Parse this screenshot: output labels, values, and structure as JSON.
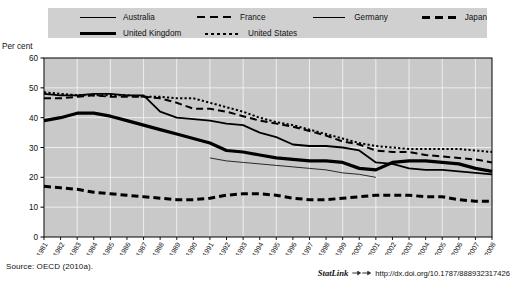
{
  "title_strip": "Figure cropped heading",
  "axis_note": "Per cent",
  "legend": {
    "items": [
      {
        "label": "Australia",
        "style": "solid-med"
      },
      {
        "label": "France",
        "style": "dash-long"
      },
      {
        "label": "Germany",
        "style": "solid-thin"
      },
      {
        "label": "Japan",
        "style": "dash-thick"
      },
      {
        "label": "United Kingdom",
        "style": "solid-thick"
      },
      {
        "label": "United States",
        "style": "dot"
      }
    ]
  },
  "source": "Source:  OECD (2010a).",
  "statlink": {
    "word": "StatLink",
    "url": "http://dx.doi.org/10.1787/888932317426"
  },
  "chart_data": {
    "type": "line",
    "title": "",
    "xlabel": "",
    "ylabel": "Per cent",
    "ylim": [
      0,
      60
    ],
    "yticks": [
      0,
      10,
      20,
      30,
      40,
      50,
      60
    ],
    "grid": true,
    "legend_position": "top",
    "x": [
      1981,
      1982,
      1983,
      1984,
      1985,
      1986,
      1987,
      1988,
      1989,
      1990,
      1991,
      1992,
      1993,
      1994,
      1995,
      1996,
      1997,
      1998,
      1999,
      2000,
      2001,
      2002,
      2003,
      2004,
      2005,
      2006,
      2007,
      2008
    ],
    "series": [
      {
        "name": "Australia",
        "style": "solid-med",
        "values": [
          48.0,
          47.5,
          47.5,
          48.0,
          48.0,
          47.5,
          47.5,
          42.0,
          40.0,
          39.5,
          39.0,
          38.0,
          37.5,
          35.0,
          33.5,
          31.0,
          30.5,
          30.5,
          30.0,
          29.0,
          25.0,
          24.5,
          23.0,
          22.5,
          22.5,
          22.0,
          21.5,
          21.0
        ]
      },
      {
        "name": "France",
        "style": "dash-long",
        "values": [
          46.5,
          46.5,
          47.0,
          47.5,
          47.0,
          47.0,
          47.0,
          46.5,
          45.0,
          43.0,
          43.0,
          42.0,
          40.5,
          39.0,
          38.0,
          37.0,
          35.5,
          34.0,
          32.0,
          31.0,
          29.0,
          28.5,
          28.5,
          27.5,
          27.0,
          26.5,
          26.0,
          25.0
        ]
      },
      {
        "name": "Germany",
        "style": "solid-thin",
        "values": [
          null,
          null,
          null,
          null,
          null,
          null,
          null,
          null,
          null,
          null,
          26.5,
          25.5,
          25.0,
          24.5,
          24.0,
          23.5,
          23.0,
          22.5,
          21.5,
          21.0,
          20.0,
          null,
          null,
          null,
          null,
          null,
          null,
          null
        ]
      },
      {
        "name": "Japan",
        "style": "dash-thick",
        "values": [
          17.0,
          16.5,
          16.0,
          15.0,
          14.5,
          14.0,
          13.5,
          13.0,
          12.5,
          12.5,
          13.0,
          14.0,
          14.5,
          14.5,
          14.0,
          13.0,
          12.5,
          12.5,
          13.0,
          13.5,
          14.0,
          14.0,
          14.0,
          13.5,
          13.5,
          12.5,
          12.0,
          12.0
        ]
      },
      {
        "name": "United Kingdom",
        "style": "solid-thick",
        "values": [
          39.0,
          40.0,
          41.5,
          41.5,
          40.5,
          39.0,
          37.5,
          36.0,
          34.5,
          33.0,
          31.5,
          29.0,
          28.5,
          27.5,
          26.5,
          26.0,
          25.5,
          25.5,
          25.0,
          23.0,
          22.5,
          25.0,
          25.5,
          25.5,
          25.0,
          24.5,
          23.0,
          22.0
        ]
      },
      {
        "name": "United States",
        "style": "dot",
        "values": [
          48.5,
          48.0,
          47.5,
          47.5,
          47.5,
          47.5,
          47.0,
          47.0,
          46.5,
          46.5,
          45.0,
          43.5,
          42.0,
          40.0,
          38.5,
          37.5,
          36.0,
          34.5,
          33.0,
          31.5,
          30.5,
          30.0,
          29.5,
          29.5,
          29.5,
          29.5,
          29.0,
          28.5
        ]
      }
    ]
  }
}
